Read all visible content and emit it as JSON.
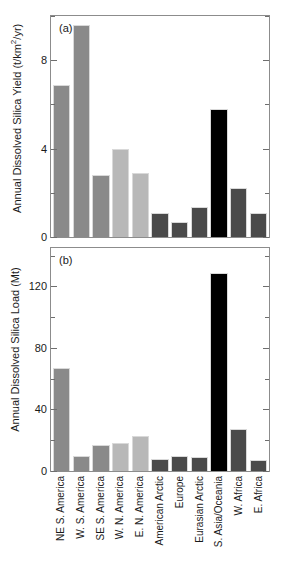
{
  "figure": {
    "categories": [
      "NE S. America",
      "W. S. America",
      "SE S. America",
      "W. N. America",
      "E. N. America",
      "American Arctic",
      "Europe",
      "Eurasian Arctic",
      "S. Asia/Oceania",
      "W. Africa",
      "E. Africa"
    ],
    "colors": {
      "medium_gray": "#8a8a8a",
      "light_gray": "#b8b8b8",
      "dark_gray": "#4a4a4a",
      "black": "#000000",
      "frame": "#8c8c8c",
      "text": "#1a1a1a"
    }
  },
  "chart_data": [
    {
      "type": "bar",
      "panel_tag": "(a)",
      "title": "",
      "xlabel": "",
      "ylabel": "Annual Dissolved Silica Yield (t/km2/yr)",
      "ylabel_units": "t/km²/yr",
      "ylim": [
        0,
        10
      ],
      "yticks": [
        0,
        4,
        8
      ],
      "yticklabels": [
        "0",
        "4",
        "8"
      ],
      "yminorticks": [
        2,
        6,
        10
      ],
      "grid": false,
      "legend": "none",
      "categories": [
        "NE S. America",
        "W. S. America",
        "SE S. America",
        "W. N. America",
        "E. N. America",
        "American Arctic",
        "Europe",
        "Eurasian Arctic",
        "S. Asia/Oceania",
        "W. Africa",
        "E. Africa"
      ],
      "values": [
        6.9,
        9.6,
        2.8,
        4.0,
        2.9,
        1.1,
        0.7,
        1.35,
        5.8,
        2.2,
        1.1
      ],
      "bar_colors": [
        "#8a8a8a",
        "#8a8a8a",
        "#8a8a8a",
        "#b8b8b8",
        "#b8b8b8",
        "#4a4a4a",
        "#4a4a4a",
        "#4a4a4a",
        "#000000",
        "#4a4a4a",
        "#4a4a4a"
      ]
    },
    {
      "type": "bar",
      "panel_tag": "(b)",
      "title": "",
      "xlabel": "",
      "ylabel": "Annual Dissolved Silica Load (Mt)",
      "ylabel_units": "Mt",
      "ylim": [
        0,
        145
      ],
      "yticks": [
        0,
        40,
        80,
        120
      ],
      "yticklabels": [
        "0",
        "40",
        "80",
        "120"
      ],
      "yminorticks": [
        20,
        60,
        100,
        140
      ],
      "grid": false,
      "legend": "none",
      "categories": [
        "NE S. America",
        "W. S. America",
        "SE S. America",
        "W. N. America",
        "E. N. America",
        "American Arctic",
        "Europe",
        "Eurasian Arctic",
        "S. Asia/Oceania",
        "W. Africa",
        "E. Africa"
      ],
      "values": [
        67,
        9.5,
        17,
        18,
        22.5,
        7.5,
        9.5,
        9,
        129,
        27.5,
        7
      ],
      "bar_colors": [
        "#8a8a8a",
        "#8a8a8a",
        "#8a8a8a",
        "#b8b8b8",
        "#b8b8b8",
        "#4a4a4a",
        "#4a4a4a",
        "#4a4a4a",
        "#000000",
        "#4a4a4a",
        "#4a4a4a"
      ]
    }
  ]
}
